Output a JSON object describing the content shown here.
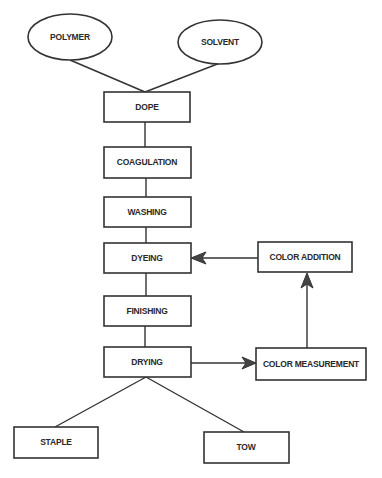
{
  "diagram": {
    "title": "",
    "colors": {
      "stroke": "#333333",
      "text": "#2a2a2a",
      "background": "#ffffff"
    },
    "nodes": {
      "polymer": {
        "label": "POLYMER",
        "shape": "ellipse"
      },
      "solvent": {
        "label": "SOLVENT",
        "shape": "ellipse"
      },
      "dope": {
        "label": "DOPE",
        "shape": "rect"
      },
      "coagulation": {
        "label": "COAGULATION",
        "shape": "rect"
      },
      "washing": {
        "label": "WASHING",
        "shape": "rect"
      },
      "dyeing": {
        "label": "DYEING",
        "shape": "rect"
      },
      "finishing": {
        "label": "FINISHING",
        "shape": "rect"
      },
      "drying": {
        "label": "DRYING",
        "shape": "rect"
      },
      "color_addition": {
        "label": "COLOR ADDITION",
        "shape": "rect"
      },
      "color_measurement": {
        "label": "COLOR MEASUREMENT",
        "shape": "rect"
      },
      "staple": {
        "label": "STAPLE",
        "shape": "rect"
      },
      "tow": {
        "label": "TOW",
        "shape": "rect"
      }
    },
    "edges": [
      {
        "from": "POLYMER",
        "to": "DOPE",
        "arrow": false
      },
      {
        "from": "SOLVENT",
        "to": "DOPE",
        "arrow": false
      },
      {
        "from": "DOPE",
        "to": "COAGULATION",
        "arrow": false
      },
      {
        "from": "COAGULATION",
        "to": "WASHING",
        "arrow": false
      },
      {
        "from": "WASHING",
        "to": "DYEING",
        "arrow": false
      },
      {
        "from": "DYEING",
        "to": "FINISHING",
        "arrow": false
      },
      {
        "from": "FINISHING",
        "to": "DRYING",
        "arrow": false
      },
      {
        "from": "DRYING",
        "to": "COLOR MEASUREMENT",
        "arrow": true
      },
      {
        "from": "COLOR MEASUREMENT",
        "to": "COLOR ADDITION",
        "arrow": true
      },
      {
        "from": "COLOR ADDITION",
        "to": "DYEING",
        "arrow": true
      },
      {
        "from": "DRYING",
        "to": "STAPLE",
        "arrow": false
      },
      {
        "from": "DRYING",
        "to": "TOW",
        "arrow": false
      }
    ]
  }
}
